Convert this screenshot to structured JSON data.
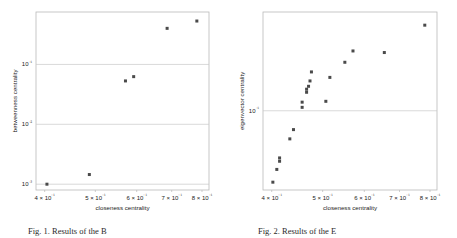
{
  "figure": {
    "background": "#ffffff",
    "marker_color": "#4a4a4a",
    "frame_color": "#b9b9b9",
    "grid_color": "#c8c8c8",
    "text_color": "#1a1a1a"
  },
  "captions": {
    "left": "Fig. 1.  Results of the B",
    "right": "Fig. 2.  Results of the E"
  },
  "chart_data": [
    {
      "type": "scatter",
      "title": "",
      "xlabel": "closeness centrality",
      "ylabel": "betweenness centrality",
      "xscale": "log",
      "yscale": "log",
      "xlim": [
        0.385,
        0.825
      ],
      "ylim": [
        0.0008,
        0.75
      ],
      "grid": true,
      "legend": null,
      "xticks": [
        0.4,
        0.5,
        0.6,
        0.7,
        0.8
      ],
      "xticklabels": [
        "4 × 10⁻¹",
        "5 × 10⁻¹",
        "6 × 10⁻¹",
        "7 × 10⁻¹",
        "8 × 10⁻¹"
      ],
      "yticks": [
        0.1,
        0.01,
        0.001
      ],
      "yticklabels": [
        "10⁻¹",
        "10⁻²",
        "10⁻³"
      ],
      "points": [
        {
          "x": 0.404,
          "y": 0.001
        },
        {
          "x": 0.487,
          "y": 0.00145
        },
        {
          "x": 0.571,
          "y": 0.053
        },
        {
          "x": 0.592,
          "y": 0.0625
        },
        {
          "x": 0.686,
          "y": 0.4
        },
        {
          "x": 0.782,
          "y": 0.53
        }
      ]
    },
    {
      "type": "scatter",
      "title": "",
      "xlabel": "closeness centrality",
      "ylabel": "eigenvector centrality",
      "xscale": "log",
      "yscale": "log",
      "xlim": [
        0.385,
        0.825
      ],
      "ylim": [
        0.021,
        0.7
      ],
      "grid": true,
      "legend": null,
      "xticks": [
        0.4,
        0.5,
        0.6,
        0.7,
        0.8
      ],
      "xticklabels": [
        "4 × 10⁻¹",
        "5 × 10⁻¹",
        "6 × 10⁻¹",
        "7 × 10⁻¹",
        "8 × 10⁻¹"
      ],
      "yticks": [
        0.1
      ],
      "yticklabels": [
        "10⁻¹"
      ],
      "points": [
        {
          "x": 0.402,
          "y": 0.0245
        },
        {
          "x": 0.409,
          "y": 0.0315
        },
        {
          "x": 0.414,
          "y": 0.037
        },
        {
          "x": 0.414,
          "y": 0.0395
        },
        {
          "x": 0.433,
          "y": 0.0575
        },
        {
          "x": 0.44,
          "y": 0.069
        },
        {
          "x": 0.457,
          "y": 0.107
        },
        {
          "x": 0.457,
          "y": 0.1185
        },
        {
          "x": 0.466,
          "y": 0.144
        },
        {
          "x": 0.466,
          "y": 0.153
        },
        {
          "x": 0.47,
          "y": 0.162
        },
        {
          "x": 0.473,
          "y": 0.18
        },
        {
          "x": 0.476,
          "y": 0.215
        },
        {
          "x": 0.507,
          "y": 0.1205
        },
        {
          "x": 0.516,
          "y": 0.193
        },
        {
          "x": 0.551,
          "y": 0.26
        },
        {
          "x": 0.571,
          "y": 0.325
        },
        {
          "x": 0.655,
          "y": 0.315
        },
        {
          "x": 0.782,
          "y": 0.54
        }
      ]
    }
  ]
}
